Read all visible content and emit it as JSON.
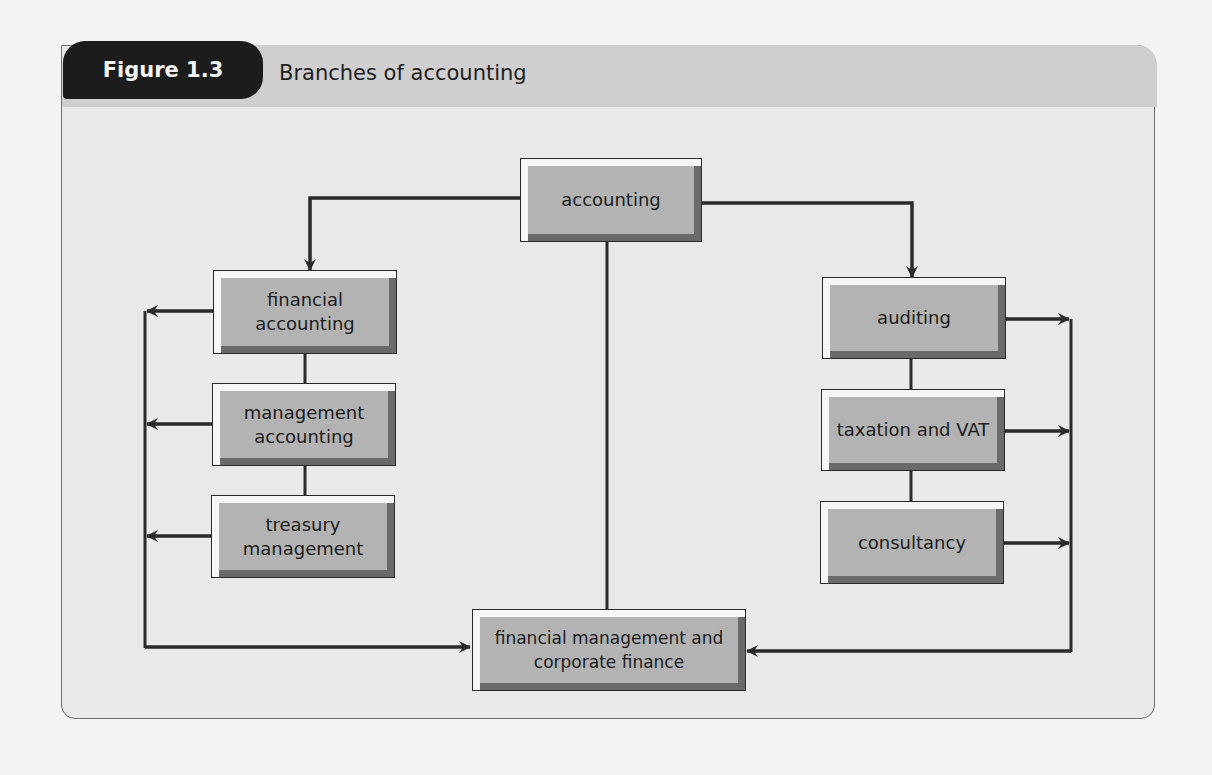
{
  "figure": {
    "label": "Figure 1.3",
    "title": "Branches of accounting"
  },
  "nodes": {
    "accounting": "accounting",
    "financial_accounting": "financial accounting",
    "management_accounting": "management accounting",
    "treasury_management": "treasury management",
    "auditing": "auditing",
    "taxation_vat": "taxation and VAT",
    "consultancy": "consultancy",
    "financial_management": "financial management and corporate finance"
  },
  "edges": [
    {
      "from": "accounting",
      "to": "financial_accounting",
      "type": "arrow"
    },
    {
      "from": "accounting",
      "to": "auditing",
      "type": "arrow"
    },
    {
      "from": "accounting",
      "to": "financial_management",
      "type": "line"
    },
    {
      "from": "financial_accounting",
      "to": "management_accounting",
      "type": "line"
    },
    {
      "from": "management_accounting",
      "to": "treasury_management",
      "type": "line"
    },
    {
      "from": "auditing",
      "to": "taxation_vat",
      "type": "line"
    },
    {
      "from": "taxation_vat",
      "to": "consultancy",
      "type": "line"
    },
    {
      "from": "financial_accounting",
      "to": "financial_management",
      "type": "arrow",
      "via": "left-bus"
    },
    {
      "from": "management_accounting",
      "to": "financial_management",
      "type": "arrow",
      "via": "left-bus"
    },
    {
      "from": "treasury_management",
      "to": "financial_management",
      "type": "arrow",
      "via": "left-bus"
    },
    {
      "from": "auditing",
      "to": "financial_management",
      "type": "arrow",
      "via": "right-bus"
    },
    {
      "from": "taxation_vat",
      "to": "financial_management",
      "type": "arrow",
      "via": "right-bus"
    },
    {
      "from": "consultancy",
      "to": "financial_management",
      "type": "arrow",
      "via": "right-bus"
    }
  ],
  "colors": {
    "tab_bg": "#1c1c1c",
    "header_bg": "#cfcfcf",
    "panel_bg": "#e9e9e8",
    "box_face": "#b3b3b3",
    "line": "#2a2a2a"
  }
}
